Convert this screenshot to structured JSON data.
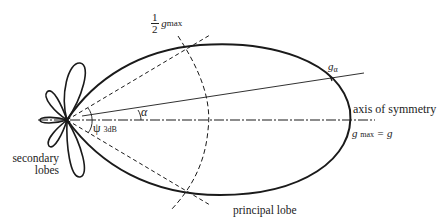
{
  "diagram": {
    "labels": {
      "half_gmax_num": "1",
      "half_gmax_den": "2",
      "half_gmax_g": "g",
      "half_gmax_sub": "max",
      "g_alpha": "g",
      "g_alpha_sub": "α",
      "alpha": "α",
      "psi": "ψ",
      "psi_sub": "3dB",
      "axis_of_symmetry": "axis of symmetry",
      "gmax_eq_g_g": "g",
      "gmax_eq_g_sub": "max",
      "gmax_eq_g_rest": " = g",
      "secondary_lobes_line1": "secondary",
      "secondary_lobes_line2": "lobes",
      "principal_lobe": "principal lobe"
    },
    "colors": {
      "stroke": "#1a1a1a",
      "background": "#ffffff"
    }
  }
}
